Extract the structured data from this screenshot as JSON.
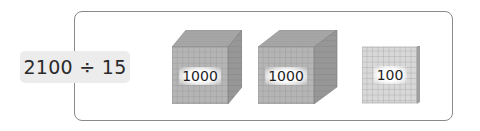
{
  "expression": {
    "text": "2100 ÷ 15",
    "dividend": 2100,
    "divisor": 15
  },
  "blocks": [
    {
      "type": "thousand-cube",
      "label": "1000",
      "value": 1000
    },
    {
      "type": "thousand-cube",
      "label": "1000",
      "value": 1000
    },
    {
      "type": "hundred-flat",
      "label": "100",
      "value": 100
    }
  ],
  "colors": {
    "frame_border": "#8a8a8a",
    "expression_bg": "#ececec",
    "cube_front": "#b3b3b3",
    "cube_top": "#a8a8a8",
    "cube_side": "#969696",
    "flat_face": "#d6d6d6",
    "grid_line": "#8f8f8f"
  }
}
